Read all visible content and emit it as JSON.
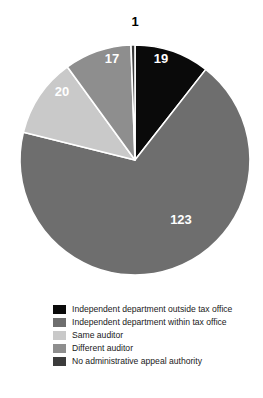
{
  "chart_data": {
    "type": "pie",
    "title": "",
    "subtitle": "",
    "xlabel": "",
    "ylabel": "",
    "total": 180,
    "grid": false,
    "legend_position": "bottom-left",
    "start_angle_deg": -90,
    "direction": "clockwise",
    "categories": [
      "Independent department outside tax office",
      "Independent department within tax office",
      "Same auditor",
      "Different auditor",
      "No administrative appeal authority"
    ],
    "values": [
      19,
      123,
      20,
      17,
      1
    ],
    "colors": [
      "#0a0a0a",
      "#6e6e6e",
      "#c9c9c9",
      "#8e8e8e",
      "#3c3c3c"
    ],
    "slices": [
      {
        "label": "Independent department outside tax office",
        "value": 19,
        "value_text": "19",
        "color": "#0a0a0a",
        "label_color": "#ffffff",
        "label_x": 161,
        "label_y": 63
      },
      {
        "label": "Independent department within tax office",
        "value": 123,
        "value_text": "123",
        "color": "#6e6e6e",
        "label_color": "#ffffff",
        "label_x": 181,
        "label_y": 224
      },
      {
        "label": "Same auditor",
        "value": 20,
        "value_text": "20",
        "color": "#c9c9c9",
        "label_color": "#ffffff",
        "label_x": 62,
        "label_y": 96
      },
      {
        "label": "Different auditor",
        "value": 17,
        "value_text": "17",
        "color": "#8e8e8e",
        "label_color": "#ffffff",
        "label_x": 112,
        "label_y": 63
      },
      {
        "label": "No administrative appeal authority",
        "value": 1,
        "value_text": "1",
        "color": "#3c3c3c",
        "label_color": "#000000",
        "label_x": 135,
        "label_y": 26
      }
    ],
    "geometry": {
      "cx": 135,
      "cy": 160,
      "r": 115,
      "separator_color": "#ffffff",
      "separator_width": 1.6
    }
  },
  "legend": {
    "items": [
      {
        "label": "Independent department outside tax office",
        "color": "#0a0a0a"
      },
      {
        "label": "Independent department within tax office",
        "color": "#6e6e6e"
      },
      {
        "label": "Same auditor",
        "color": "#c9c9c9"
      },
      {
        "label": "Different auditor",
        "color": "#8e8e8e"
      },
      {
        "label": "No administrative appeal authority",
        "color": "#3c3c3c"
      }
    ]
  }
}
